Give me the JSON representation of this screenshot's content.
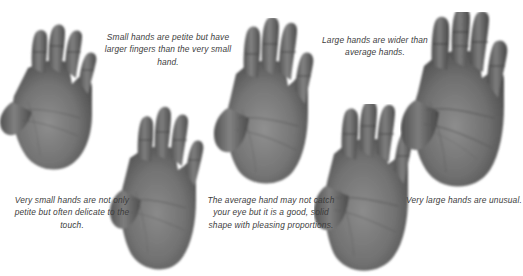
{
  "page": {
    "background_color": "#ffffff",
    "text_color": "#3d3d3d",
    "hand_tone_light": "#9a9a9a",
    "hand_tone_mid": "#6f6f6f",
    "hand_tone_dark": "#4a4a4a",
    "width": 523,
    "height": 276
  },
  "captions": {
    "small_hand": "Small hands are petite but have larger fingers than the very small hand.",
    "large_hand": "Large hands are wider than average hands.",
    "very_small_hand": "Very small hands are not only petite but often delicate to the touch.",
    "average_hand": "The average hand may not catch your eye but it is a good, solid shape with pleasing proportions.",
    "very_large_hand": "Very large hands are unusual."
  },
  "figures": [
    {
      "name": "very-small-hand-photo",
      "order": 1,
      "label": "Very small hand"
    },
    {
      "name": "small-hand-photo",
      "order": 2,
      "label": "Small hand"
    },
    {
      "name": "average-hand-photo",
      "order": 3,
      "label": "Average hand"
    },
    {
      "name": "large-hand-photo",
      "order": 4,
      "label": "Large hand"
    },
    {
      "name": "very-large-hand-photo",
      "order": 5,
      "label": "Very large hand"
    }
  ]
}
